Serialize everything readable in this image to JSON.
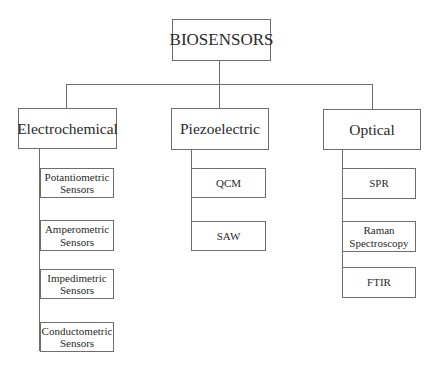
{
  "diagram": {
    "root": {
      "label": "BIOSENSORS"
    },
    "categories": [
      {
        "label": "Electrochemical",
        "children": [
          {
            "label": "Potantiometric\nSensors"
          },
          {
            "label": "Amperometric\nSensors"
          },
          {
            "label": "Impedimetric\nSensors"
          },
          {
            "label": "Conductometric\nSensors"
          }
        ]
      },
      {
        "label": "Piezoelectric",
        "children": [
          {
            "label": "QCM"
          },
          {
            "label": "SAW"
          }
        ]
      },
      {
        "label": "Optical",
        "children": [
          {
            "label": "SPR"
          },
          {
            "label": "Raman\nSpectroscopy"
          },
          {
            "label": "FTIR"
          }
        ]
      }
    ],
    "colors": {
      "stroke": "#6e6e6e",
      "text": "#2a2a2a",
      "background": "#ffffff"
    }
  }
}
